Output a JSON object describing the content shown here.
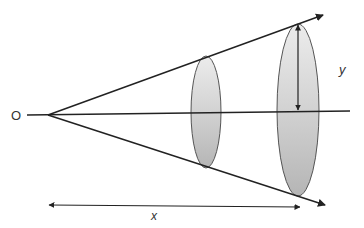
{
  "diagram": {
    "type": "cone-projection",
    "labels": {
      "origin": "O",
      "height": "y",
      "distance": "x"
    },
    "colors": {
      "line": "#222222",
      "ellipse_fill_light": "#e6e6e6",
      "ellipse_fill_dark": "#b8b8b8",
      "ellipse_stroke": "#555555",
      "label": "#333333"
    },
    "elements": {
      "apex": [
        48,
        115
      ],
      "axis": {
        "from": [
          27,
          115
        ],
        "to": [
          350,
          111
        ]
      },
      "upper_ray": {
        "from": [
          48,
          115
        ],
        "to": [
          323,
          15
        ]
      },
      "lower_ray": {
        "from": [
          48,
          115
        ],
        "to": [
          325,
          205
        ]
      },
      "small_ellipse": {
        "cx": 206,
        "cy": 112,
        "rx": 15,
        "ry": 56
      },
      "large_ellipse": {
        "cx": 298,
        "cy": 110,
        "rx": 21,
        "ry": 86
      },
      "y_arrow": {
        "x": 298,
        "from_y": 25,
        "to_y": 111
      },
      "x_arrow": {
        "from": [
          49,
          205
        ],
        "to": [
          300,
          207
        ]
      }
    }
  }
}
